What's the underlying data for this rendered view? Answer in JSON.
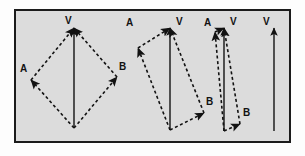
{
  "figure": {
    "kind": "vector-addition-parallelogram-series",
    "background_color": "#dcdcdc",
    "page_color": "#fdfdfd",
    "border_color": "#1b1b1b",
    "stroke_color": "#121212",
    "resultant_style": "solid",
    "component_style": "dashed",
    "labels": {
      "resultant": "V",
      "component_a": "A",
      "component_b": "B"
    },
    "frame": {
      "x": 14,
      "y": 9,
      "width": 277,
      "height": 134
    }
  },
  "chart_data": {
    "type": "diagram",
    "title": "",
    "xlabel": "",
    "ylabel": "",
    "series": [
      {
        "name": "panel-1",
        "label": "wide-angle parallelogram",
        "origin": [
          74,
          128
        ],
        "tip": [
          74,
          28
        ],
        "vertex_a": [
          31,
          80
        ],
        "vertex_b": [
          117,
          77
        ],
        "angle_between_components": 110,
        "vectors": [
          {
            "name": "V",
            "from": [
              74,
              128
            ],
            "to": [
              74,
              28
            ],
            "style": "solid",
            "label": "V",
            "label_pos": [
              65,
              24
            ]
          },
          {
            "name": "A",
            "from": [
              74,
              128
            ],
            "to": [
              31,
              80
            ],
            "style": "dashed",
            "label": "A",
            "label_pos": [
              20,
              72
            ]
          },
          {
            "name": "B",
            "from": [
              74,
              128
            ],
            "to": [
              117,
              77
            ],
            "style": "dashed",
            "label": "B",
            "label_pos": [
              119,
              70
            ]
          },
          {
            "name": "A-translated",
            "from": [
              31,
              80
            ],
            "to": [
              74,
              28
            ],
            "style": "dashed",
            "label": "",
            "label_pos": [
              0,
              0
            ]
          },
          {
            "name": "B-translated",
            "from": [
              117,
              77
            ],
            "to": [
              74,
              28
            ],
            "style": "dashed",
            "label": "",
            "label_pos": [
              0,
              0
            ]
          }
        ]
      },
      {
        "name": "panel-2",
        "label": "medium-angle parallelogram",
        "origin": [
          170,
          130
        ],
        "tip": [
          170,
          28
        ],
        "vertex_a": [
          138,
          48
        ],
        "vertex_b": [
          204,
          113
        ],
        "angle_between_components": 70,
        "vectors": [
          {
            "name": "V",
            "from": [
              170,
              130
            ],
            "to": [
              170,
              28
            ],
            "style": "solid",
            "label": "V",
            "label_pos": [
              176,
              25
            ]
          },
          {
            "name": "A",
            "from": [
              170,
              130
            ],
            "to": [
              138,
              48
            ],
            "style": "dashed",
            "label": "A",
            "label_pos": [
              126,
              26
            ]
          },
          {
            "name": "B",
            "from": [
              170,
              130
            ],
            "to": [
              204,
              113
            ],
            "style": "dashed",
            "label": "B",
            "label_pos": [
              206,
              105
            ]
          },
          {
            "name": "A-translated",
            "from": [
              138,
              48
            ],
            "to": [
              170,
              28
            ],
            "style": "dashed",
            "label": "",
            "label_pos": [
              0,
              0
            ]
          },
          {
            "name": "B-translated",
            "from": [
              204,
              113
            ],
            "to": [
              170,
              28
            ],
            "style": "dashed",
            "label": "",
            "label_pos": [
              0,
              0
            ]
          }
        ]
      },
      {
        "name": "panel-3",
        "label": "narrow-angle parallelogram",
        "origin": [
          224,
          131
        ],
        "tip": [
          224,
          28
        ],
        "vertex_a": [
          215,
          32
        ],
        "vertex_b": [
          240,
          124
        ],
        "angle_between_components": 22,
        "vectors": [
          {
            "name": "V",
            "from": [
              224,
              131
            ],
            "to": [
              224,
              28
            ],
            "style": "solid",
            "label": "V",
            "label_pos": [
              230,
              25
            ]
          },
          {
            "name": "A",
            "from": [
              224,
              131
            ],
            "to": [
              215,
              32
            ],
            "style": "dashed",
            "label": "A",
            "label_pos": [
              204,
              26
            ]
          },
          {
            "name": "B",
            "from": [
              224,
              131
            ],
            "to": [
              240,
              124
            ],
            "style": "dashed",
            "label": "B",
            "label_pos": [
              243,
              116
            ]
          },
          {
            "name": "A-translated",
            "from": [
              215,
              32
            ],
            "to": [
              224,
              28
            ],
            "style": "dashed",
            "label": "",
            "label_pos": [
              0,
              0
            ]
          },
          {
            "name": "B-translated",
            "from": [
              240,
              124
            ],
            "to": [
              224,
              28
            ],
            "style": "dashed",
            "label": "",
            "label_pos": [
              0,
              0
            ]
          }
        ]
      },
      {
        "name": "panel-4",
        "label": "collinear limit",
        "origin": [
          274,
          131
        ],
        "tip": [
          274,
          28
        ],
        "angle_between_components": 0,
        "vectors": [
          {
            "name": "V",
            "from": [
              274,
              131
            ],
            "to": [
              274,
              28
            ],
            "style": "solid",
            "label": "V",
            "label_pos": [
              263,
              25
            ]
          }
        ]
      }
    ]
  }
}
